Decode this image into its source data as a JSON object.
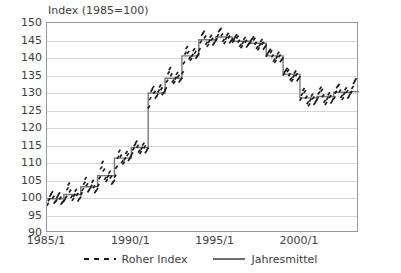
{
  "chart_data": {
    "type": "line",
    "title": "Index (1985=100)",
    "xlabel": "",
    "ylabel": "",
    "ylim": [
      90,
      150
    ],
    "ytick_labels": [
      "150",
      "145",
      "140",
      "135",
      "130",
      "125",
      "120",
      "115",
      "110",
      "105",
      "100",
      "95",
      "90"
    ],
    "ytick_values": [
      150,
      145,
      140,
      135,
      130,
      125,
      120,
      115,
      110,
      105,
      100,
      95,
      90
    ],
    "xtick_labels": [
      "1985/1",
      "1990/1",
      "1995/1",
      "2000/1"
    ],
    "xtick_values": [
      1985.0,
      1990.0,
      1995.0,
      2000.0
    ],
    "xlim": [
      1985.0,
      2003.5
    ],
    "grid": "horizontal",
    "legend_position": "bottom-center",
    "legend": [
      "Roher Index",
      "Jahresmittel"
    ],
    "colors": {
      "raw_points": "#1a1a1a",
      "annual_mean_line": "#7a7a7a",
      "gridline": "#d8d8d8",
      "frame": "#9a9a9a",
      "text": "#404040"
    },
    "series": [
      {
        "name": "Roher Index",
        "style": "scatter-dashes",
        "x": [
          1985.04,
          1985.12,
          1985.21,
          1985.29,
          1985.37,
          1985.46,
          1985.54,
          1985.62,
          1985.71,
          1985.79,
          1985.87,
          1985.96,
          1986.04,
          1986.12,
          1986.21,
          1986.29,
          1986.37,
          1986.46,
          1986.54,
          1986.62,
          1986.71,
          1986.79,
          1986.87,
          1986.96,
          1987.04,
          1987.12,
          1987.21,
          1987.29,
          1987.37,
          1987.46,
          1987.54,
          1987.62,
          1987.71,
          1987.79,
          1987.87,
          1987.96,
          1988.04,
          1988.12,
          1988.21,
          1988.29,
          1988.37,
          1988.46,
          1988.54,
          1988.62,
          1988.71,
          1988.79,
          1988.87,
          1988.96,
          1989.04,
          1989.12,
          1989.21,
          1989.29,
          1989.37,
          1989.46,
          1989.54,
          1989.62,
          1989.71,
          1989.79,
          1989.87,
          1989.96,
          1990.04,
          1990.12,
          1990.21,
          1990.29,
          1990.37,
          1990.46,
          1990.54,
          1990.62,
          1990.71,
          1990.79,
          1990.87,
          1990.96,
          1991.04,
          1991.12,
          1991.21,
          1991.29,
          1991.37,
          1991.46,
          1991.54,
          1991.62,
          1991.71,
          1991.79,
          1991.87,
          1991.96,
          1992.04,
          1992.12,
          1992.21,
          1992.29,
          1992.37,
          1992.46,
          1992.54,
          1992.62,
          1992.71,
          1992.79,
          1992.87,
          1992.96,
          1993.04,
          1993.12,
          1993.21,
          1993.29,
          1993.37,
          1993.46,
          1993.54,
          1993.62,
          1993.71,
          1993.79,
          1993.87,
          1993.96,
          1994.04,
          1994.12,
          1994.21,
          1994.29,
          1994.37,
          1994.46,
          1994.54,
          1994.62,
          1994.71,
          1994.79,
          1994.87,
          1994.96,
          1995.04,
          1995.12,
          1995.21,
          1995.29,
          1995.37,
          1995.46,
          1995.54,
          1995.62,
          1995.71,
          1995.79,
          1995.87,
          1995.96,
          1996.04,
          1996.12,
          1996.21,
          1996.29,
          1996.37,
          1996.46,
          1996.54,
          1996.62,
          1996.71,
          1996.79,
          1996.87,
          1996.96,
          1997.04,
          1997.12,
          1997.21,
          1997.29,
          1997.37,
          1997.46,
          1997.54,
          1997.62,
          1997.71,
          1997.79,
          1997.87,
          1997.96,
          1998.04,
          1998.12,
          1998.21,
          1998.29,
          1998.37,
          1998.46,
          1998.54,
          1998.62,
          1998.71,
          1998.79,
          1998.87,
          1998.96,
          1999.04,
          1999.12,
          1999.21,
          1999.29,
          1999.37,
          1999.46,
          1999.54,
          1999.62,
          1999.71,
          1999.79,
          1999.87,
          1999.96,
          2000.04,
          2000.12,
          2000.21,
          2000.29,
          2000.37,
          2000.46,
          2000.54,
          2000.62,
          2000.71,
          2000.79,
          2000.87,
          2000.96,
          2001.04,
          2001.12,
          2001.21,
          2001.29,
          2001.37,
          2001.46,
          2001.54,
          2001.62,
          2001.71,
          2001.79,
          2001.87,
          2001.96,
          2002.04,
          2002.12,
          2002.21,
          2002.29,
          2002.37,
          2002.46,
          2002.54,
          2002.62,
          2002.71,
          2002.79,
          2002.87,
          2002.96,
          2003.04,
          2003.12,
          2003.21,
          2003.29
        ],
        "y": [
          98.2,
          99.5,
          100.8,
          101.5,
          100.2,
          98.8,
          99.2,
          100.4,
          101.2,
          100.0,
          98.5,
          99.0,
          99.4,
          100.2,
          102.6,
          104.0,
          102.0,
          100.4,
          99.6,
          100.8,
          102.2,
          101.0,
          99.4,
          100.0,
          101.2,
          102.4,
          104.2,
          105.6,
          103.8,
          102.0,
          102.6,
          103.4,
          104.8,
          103.2,
          101.8,
          102.4,
          103.6,
          105.8,
          108.6,
          110.2,
          108.0,
          105.6,
          105.0,
          106.2,
          107.4,
          106.0,
          104.2,
          104.8,
          106.2,
          108.8,
          111.6,
          113.4,
          112.0,
          110.4,
          110.0,
          111.2,
          113.0,
          112.4,
          111.0,
          111.8,
          112.6,
          114.0,
          115.2,
          116.0,
          114.8,
          113.4,
          113.0,
          114.2,
          115.4,
          114.6,
          113.2,
          114.0,
          126.0,
          128.4,
          130.8,
          131.6,
          130.2,
          128.8,
          129.4,
          130.6,
          132.0,
          131.2,
          129.8,
          130.4,
          131.2,
          133.4,
          135.8,
          137.0,
          135.2,
          133.4,
          133.0,
          134.2,
          135.6,
          134.8,
          133.4,
          134.0,
          135.8,
          138.6,
          141.4,
          143.0,
          141.6,
          140.0,
          139.6,
          140.8,
          142.4,
          141.6,
          140.2,
          141.0,
          142.4,
          144.6,
          146.8,
          147.4,
          146.0,
          144.2,
          143.6,
          144.8,
          146.2,
          145.4,
          144.0,
          144.6,
          145.2,
          146.4,
          147.8,
          148.2,
          146.6,
          145.0,
          144.4,
          145.6,
          146.8,
          146.0,
          144.6,
          145.2,
          144.8,
          145.6,
          146.4,
          146.0,
          144.8,
          143.6,
          143.2,
          144.4,
          145.6,
          144.8,
          143.4,
          144.0,
          144.4,
          145.2,
          145.8,
          145.4,
          144.2,
          143.0,
          142.6,
          143.8,
          145.0,
          144.2,
          142.8,
          143.4,
          140.8,
          141.6,
          142.2,
          141.8,
          140.6,
          139.4,
          139.0,
          140.2,
          141.4,
          140.6,
          139.2,
          139.8,
          135.4,
          136.2,
          136.8,
          136.4,
          135.2,
          134.0,
          133.6,
          134.8,
          136.0,
          135.2,
          133.8,
          134.4,
          128.2,
          129.6,
          131.0,
          130.4,
          128.8,
          127.2,
          126.6,
          128.0,
          129.4,
          128.6,
          127.0,
          127.8,
          128.4,
          130.0,
          131.4,
          130.8,
          129.2,
          127.6,
          127.0,
          128.4,
          129.8,
          129.0,
          127.4,
          128.2,
          128.6,
          130.2,
          131.8,
          132.2,
          130.6,
          129.0,
          128.4,
          129.8,
          131.2,
          130.4,
          128.8,
          129.6,
          130.2,
          131.6,
          133.0,
          133.8
        ]
      },
      {
        "name": "Jahresmittel",
        "style": "step",
        "x": [
          1985,
          1986,
          1987,
          1988,
          1989,
          1990,
          1991,
          1992,
          1993,
          1994,
          1995,
          1996,
          1997,
          1998,
          1999,
          2000,
          2001,
          2002,
          2003,
          2003.5
        ],
        "y": [
          99.8,
          101.0,
          103.2,
          106.4,
          111.4,
          114.4,
          130.0,
          134.2,
          140.6,
          145.2,
          146.0,
          144.8,
          144.2,
          140.6,
          135.4,
          128.6,
          129.0,
          130.2,
          130.4,
          130.4
        ]
      }
    ]
  }
}
